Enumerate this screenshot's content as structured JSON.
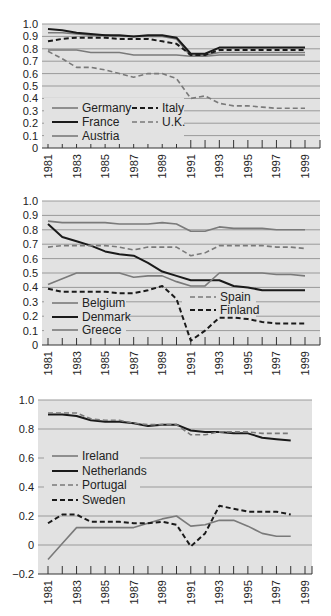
{
  "chart_data": [
    {
      "type": "line",
      "title": "",
      "xlabel": "",
      "ylabel": "",
      "ylim": [
        0,
        1.0
      ],
      "yticks": [
        "0",
        "0.1",
        "0.2",
        "0.3",
        "0.4",
        "0.5",
        "0.6",
        "0.7",
        "0.8",
        "0.9",
        "1.0"
      ],
      "xticks": [
        "1981",
        "1983",
        "1985",
        "1987",
        "1989",
        "1991",
        "1993",
        "1995",
        "1997",
        "1999"
      ],
      "grid": true,
      "legend_position": "lower-left inside",
      "x": [
        1981,
        1982,
        1983,
        1984,
        1985,
        1986,
        1987,
        1988,
        1989,
        1990,
        1991,
        1992,
        1993,
        1994,
        1995,
        1996,
        1997,
        1998,
        1999
      ],
      "series": [
        {
          "name": "Germany",
          "style": "solid-gray",
          "values": [
            0.93,
            0.93,
            0.92,
            0.91,
            0.91,
            0.9,
            0.9,
            0.9,
            0.9,
            0.88,
            0.74,
            0.75,
            0.77,
            0.77,
            0.77,
            0.77,
            0.77,
            0.77,
            0.77
          ]
        },
        {
          "name": "France",
          "style": "solid-black",
          "values": [
            0.96,
            0.95,
            0.93,
            0.92,
            0.91,
            0.91,
            0.9,
            0.91,
            0.91,
            0.89,
            0.76,
            0.76,
            0.81,
            0.81,
            0.81,
            0.81,
            0.81,
            0.81,
            0.81
          ]
        },
        {
          "name": "Austria",
          "style": "solid-gray",
          "values": [
            0.79,
            0.79,
            0.79,
            0.77,
            0.77,
            0.77,
            0.75,
            0.75,
            0.75,
            0.75,
            0.74,
            0.74,
            0.75,
            0.75,
            0.75,
            0.75,
            0.75,
            0.75,
            0.75
          ]
        },
        {
          "name": "Italy",
          "style": "dashed-black",
          "values": [
            0.86,
            0.88,
            0.89,
            0.89,
            0.89,
            0.88,
            0.88,
            0.88,
            0.86,
            0.84,
            0.75,
            0.75,
            0.79,
            0.79,
            0.79,
            0.79,
            0.79,
            0.79,
            0.79
          ]
        },
        {
          "name": "U.K.",
          "style": "dashed-gray",
          "values": [
            0.78,
            0.72,
            0.65,
            0.65,
            0.63,
            0.6,
            0.57,
            0.6,
            0.6,
            0.56,
            0.4,
            0.42,
            0.36,
            0.34,
            0.34,
            0.33,
            0.32,
            0.32,
            0.32
          ]
        }
      ]
    },
    {
      "type": "line",
      "title": "",
      "xlabel": "",
      "ylabel": "",
      "ylim": [
        0,
        1.0
      ],
      "yticks": [
        "0",
        "0.1",
        "0.2",
        "0.3",
        "0.4",
        "0.5",
        "0.6",
        "0.7",
        "0.8",
        "0.9",
        "1.0"
      ],
      "xticks": [
        "1981",
        "1983",
        "1985",
        "1987",
        "1989",
        "1991",
        "1993",
        "1995",
        "1997",
        "1999"
      ],
      "grid": true,
      "legend_position": "lower inside, split left/right",
      "x": [
        1981,
        1982,
        1983,
        1984,
        1985,
        1986,
        1987,
        1988,
        1989,
        1990,
        1991,
        1992,
        1993,
        1994,
        1995,
        1996,
        1997,
        1998,
        1999
      ],
      "series": [
        {
          "name": "Belgium",
          "style": "solid-gray",
          "values": [
            0.86,
            0.85,
            0.85,
            0.85,
            0.85,
            0.84,
            0.84,
            0.84,
            0.85,
            0.84,
            0.79,
            0.79,
            0.82,
            0.81,
            0.81,
            0.81,
            0.8,
            0.8,
            0.8
          ]
        },
        {
          "name": "Denmark",
          "style": "solid-black",
          "values": [
            0.84,
            0.75,
            0.72,
            0.69,
            0.65,
            0.63,
            0.62,
            0.57,
            0.51,
            0.48,
            0.45,
            0.45,
            0.45,
            0.41,
            0.4,
            0.38,
            0.38,
            0.38,
            0.38
          ]
        },
        {
          "name": "Greece",
          "style": "solid-gray",
          "values": [
            0.42,
            0.46,
            0.5,
            0.5,
            0.5,
            0.5,
            0.47,
            0.48,
            0.48,
            0.44,
            0.41,
            0.41,
            0.5,
            0.5,
            0.5,
            0.5,
            0.49,
            0.49,
            0.48
          ]
        },
        {
          "name": "Spain",
          "style": "dashed-gray",
          "values": [
            0.68,
            0.69,
            0.69,
            0.69,
            0.69,
            0.68,
            0.66,
            0.68,
            0.68,
            0.68,
            0.62,
            0.64,
            0.69,
            0.69,
            0.69,
            0.69,
            0.68,
            0.68,
            0.67
          ]
        },
        {
          "name": "Finland",
          "style": "dashed-black",
          "values": [
            0.39,
            0.37,
            0.37,
            0.37,
            0.37,
            0.36,
            0.36,
            0.38,
            0.41,
            0.32,
            0.03,
            0.1,
            0.19,
            0.19,
            0.18,
            0.16,
            0.15,
            0.15,
            0.15
          ]
        }
      ]
    },
    {
      "type": "line",
      "title": "",
      "xlabel": "",
      "ylabel": "",
      "ylim": [
        -0.2,
        1.0
      ],
      "yticks": [
        "−0.2",
        "0",
        "0.2",
        "0.4",
        "0.6",
        "0.8",
        "1.0"
      ],
      "xticks": [
        "1981",
        "1983",
        "1985",
        "1987",
        "1989",
        "1991",
        "1993",
        "1995",
        "1997",
        "1999"
      ],
      "grid": true,
      "legend_position": "upper-left inside",
      "x": [
        1981,
        1982,
        1983,
        1984,
        1985,
        1986,
        1987,
        1988,
        1989,
        1990,
        1991,
        1992,
        1993,
        1994,
        1995,
        1996,
        1997,
        1998
      ],
      "series": [
        {
          "name": "Ireland",
          "style": "solid-gray",
          "values": [
            -0.1,
            0.01,
            0.12,
            0.12,
            0.12,
            0.12,
            0.12,
            0.15,
            0.18,
            0.2,
            0.13,
            0.14,
            0.17,
            0.17,
            0.13,
            0.08,
            0.06,
            0.06
          ]
        },
        {
          "name": "Netherlands",
          "style": "solid-black",
          "values": [
            0.9,
            0.9,
            0.89,
            0.86,
            0.85,
            0.85,
            0.84,
            0.82,
            0.83,
            0.83,
            0.79,
            0.78,
            0.78,
            0.77,
            0.77,
            0.74,
            0.73,
            0.72
          ]
        },
        {
          "name": "Portugal",
          "style": "dashed-gray",
          "values": [
            0.91,
            0.91,
            0.91,
            0.87,
            0.86,
            0.86,
            0.84,
            0.83,
            0.83,
            0.83,
            0.76,
            0.76,
            0.78,
            0.78,
            0.78,
            0.77,
            0.77,
            0.77
          ]
        },
        {
          "name": "Sweden",
          "style": "dashed-black",
          "values": [
            0.15,
            0.21,
            0.21,
            0.16,
            0.16,
            0.16,
            0.15,
            0.15,
            0.16,
            0.14,
            -0.01,
            0.08,
            0.27,
            0.25,
            0.23,
            0.23,
            0.23,
            0.21
          ]
        }
      ]
    }
  ],
  "charts": [
    {
      "legend": [
        {
          "label": "Germany"
        },
        {
          "label": "France"
        },
        {
          "label": "Austria"
        },
        {
          "label": "Italy"
        },
        {
          "label": "U.K."
        }
      ]
    },
    {
      "legend": [
        {
          "label": "Belgium"
        },
        {
          "label": "Denmark"
        },
        {
          "label": "Greece"
        },
        {
          "label": "Spain"
        },
        {
          "label": "Finland"
        }
      ]
    },
    {
      "legend": [
        {
          "label": "Ireland"
        },
        {
          "label": "Netherlands"
        },
        {
          "label": "Portugal"
        },
        {
          "label": "Sweden"
        }
      ]
    }
  ],
  "colors": {
    "plot_bg": "#e2e2e2",
    "grid": "#9a9a9a",
    "black_line": "#1a1a1a",
    "gray_line": "#7a7a7a",
    "axis": "#333333"
  }
}
